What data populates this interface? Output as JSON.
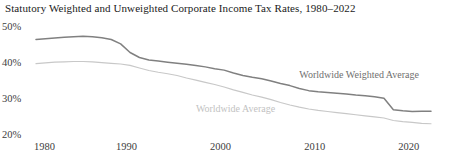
{
  "chart_data": {
    "type": "line",
    "title": "Statutory Weighted and Unweighted Corporate Income Tax Rates, 1980–2022",
    "xlabel": "",
    "ylabel": "",
    "xlim": [
      1980,
      2022
    ],
    "ylim": [
      20,
      50
    ],
    "grid": false,
    "legend_position": "inline-annotation",
    "y_tick_labels": [
      "50%",
      "40%",
      "30%",
      "20%"
    ],
    "y_ticks": [
      50,
      40,
      30,
      20
    ],
    "x_tick_labels": [
      "1980",
      "1990",
      "2000",
      "2010",
      "2020"
    ],
    "x_ticks": [
      1980,
      1990,
      2000,
      2010,
      2020
    ],
    "x": [
      1980,
      1981,
      1982,
      1983,
      1984,
      1985,
      1986,
      1987,
      1988,
      1989,
      1990,
      1991,
      1992,
      1993,
      1994,
      1995,
      1996,
      1997,
      1998,
      1999,
      2000,
      2001,
      2002,
      2003,
      2004,
      2005,
      2006,
      2007,
      2008,
      2009,
      2010,
      2011,
      2012,
      2013,
      2014,
      2015,
      2016,
      2017,
      2018,
      2019,
      2020,
      2021,
      2022
    ],
    "series": [
      {
        "name": "Worldwide Weighted Average",
        "color": "#808080",
        "values": [
          46.8,
          47.0,
          47.2,
          47.4,
          47.6,
          47.7,
          47.6,
          47.3,
          46.8,
          45.6,
          43.2,
          41.8,
          41.1,
          40.8,
          40.5,
          40.2,
          39.9,
          39.6,
          39.2,
          38.7,
          38.3,
          37.5,
          36.8,
          36.3,
          35.9,
          35.3,
          34.6,
          34.0,
          33.2,
          32.6,
          32.3,
          32.1,
          31.9,
          31.7,
          31.4,
          31.2,
          30.9,
          30.5,
          27.3,
          27.0,
          26.8,
          26.9,
          26.9
        ],
        "label_x": 2008,
        "label_y": 37.0
      },
      {
        "name": "Worldwide Average",
        "color": "#c8c8c8",
        "values": [
          40.1,
          40.3,
          40.5,
          40.6,
          40.7,
          40.7,
          40.6,
          40.4,
          40.2,
          40.0,
          39.6,
          38.9,
          38.2,
          37.7,
          37.3,
          36.8,
          36.1,
          35.5,
          34.9,
          34.3,
          33.6,
          32.8,
          32.1,
          31.4,
          30.8,
          30.1,
          29.3,
          28.6,
          28.0,
          27.5,
          27.1,
          26.8,
          26.5,
          26.2,
          25.9,
          25.6,
          25.3,
          25.0,
          24.3,
          24.0,
          23.8,
          23.5,
          23.4
        ],
        "label_x": 1997,
        "label_y": 27.4
      }
    ]
  },
  "axis": {
    "y_labels": [
      {
        "text": "50%",
        "value": 50
      },
      {
        "text": "40%",
        "value": 40
      },
      {
        "text": "30%",
        "value": 30
      },
      {
        "text": "20%",
        "value": 20
      }
    ],
    "x_labels": [
      {
        "text": "1980",
        "value": 1980
      },
      {
        "text": "1990",
        "value": 1990
      },
      {
        "text": "2000",
        "value": 2000
      },
      {
        "text": "2010",
        "value": 2010
      },
      {
        "text": "2020",
        "value": 2020
      }
    ]
  }
}
